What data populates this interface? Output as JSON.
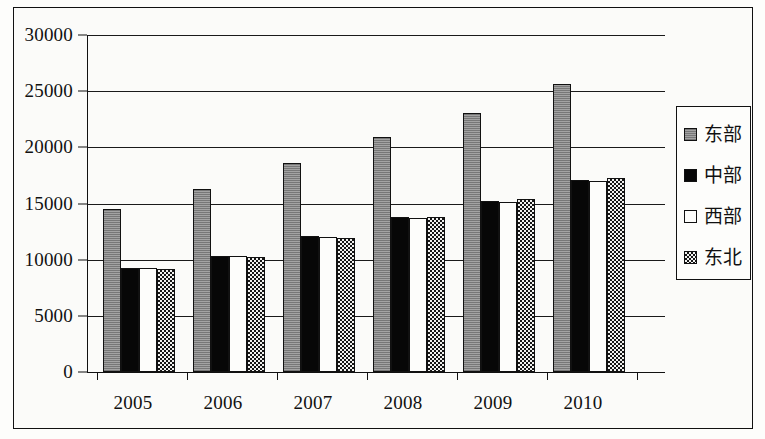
{
  "chart_data": {
    "type": "bar",
    "title": "",
    "subtitle": "",
    "xlabel": "",
    "ylabel": "",
    "categories": [
      "2005",
      "2006",
      "2007",
      "2008",
      "2009",
      "2010"
    ],
    "ylim": [
      0,
      30000
    ],
    "ytick_values": [
      0,
      5000,
      10000,
      15000,
      20000,
      25000,
      30000
    ],
    "ytick_labels": [
      "0",
      "5000",
      "10000",
      "15000",
      "20000",
      "25000",
      "30000"
    ],
    "grid": true,
    "grid_axis": "y",
    "legend_position": "right",
    "series": [
      {
        "name": "东部",
        "fill": "gray",
        "color": "#919191",
        "values": [
          14500,
          16300,
          18600,
          20900,
          23100,
          25600
        ]
      },
      {
        "name": "中部",
        "fill": "black",
        "color": "#070707",
        "values": [
          9300,
          10300,
          12100,
          13800,
          15200,
          17100
        ]
      },
      {
        "name": "西部",
        "fill": "white",
        "color": "#fdfdfb",
        "values": [
          9300,
          10300,
          12000,
          13700,
          15100,
          17000
        ]
      },
      {
        "name": "东北",
        "fill": "checker",
        "color": "#151515",
        "values": [
          9200,
          10250,
          11950,
          13800,
          15400,
          17300
        ]
      }
    ]
  },
  "legend": {
    "entries": [
      {
        "label": "东部",
        "swatch": "gray-swatch"
      },
      {
        "label": "中部",
        "swatch": "black-swatch"
      },
      {
        "label": "西部",
        "swatch": "white-swatch"
      },
      {
        "label": "东北",
        "swatch": "checker-swatch"
      }
    ]
  }
}
